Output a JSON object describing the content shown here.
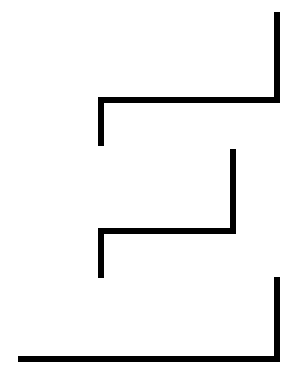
{
  "document": {
    "kind": "line-drawing",
    "width": 297,
    "height": 387,
    "background_color": "#ffffff",
    "stroke_color": "#000000",
    "stroke_width": 6,
    "title": "",
    "visible_text": []
  },
  "figure": {
    "name": "zigzag-line-glyph",
    "stroke_count": 3,
    "strokes": [
      {
        "name": "top-stroke",
        "path": "M 277 12 L 277 100 L 101 100 L 101 146",
        "segments": [
          {
            "name": "top-right-vertical",
            "orientation": "vertical",
            "x1": 277,
            "y1": 12,
            "x2": 277,
            "y2": 100
          },
          {
            "name": "upper-horizontal",
            "orientation": "horizontal",
            "x1": 277,
            "y1": 100,
            "x2": 101,
            "y2": 100
          },
          {
            "name": "upper-left-vertical",
            "orientation": "vertical",
            "x1": 101,
            "y1": 100,
            "x2": 101,
            "y2": 146
          }
        ]
      },
      {
        "name": "middle-stroke",
        "path": "M 233 149 L 233 231 L 101 231 L 101 278",
        "segments": [
          {
            "name": "middle-right-vertical",
            "orientation": "vertical",
            "x1": 233,
            "y1": 149,
            "x2": 233,
            "y2": 231
          },
          {
            "name": "middle-horizontal",
            "orientation": "horizontal",
            "x1": 233,
            "y1": 231,
            "x2": 101,
            "y2": 231
          },
          {
            "name": "middle-left-vertical",
            "orientation": "vertical",
            "x1": 101,
            "y1": 231,
            "x2": 101,
            "y2": 278
          }
        ]
      },
      {
        "name": "bottom-stroke",
        "path": "M 277 277 L 277 359 L 18 359",
        "segments": [
          {
            "name": "bottom-right-vertical",
            "orientation": "vertical",
            "x1": 277,
            "y1": 277,
            "x2": 277,
            "y2": 359
          },
          {
            "name": "bottom-horizontal",
            "orientation": "horizontal",
            "x1": 277,
            "y1": 359,
            "x2": 18,
            "y2": 359
          }
        ]
      }
    ]
  }
}
